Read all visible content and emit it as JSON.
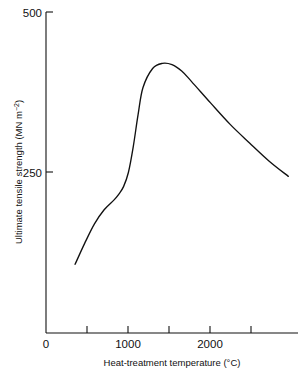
{
  "chart_data": {
    "type": "line",
    "title": "",
    "xlabel": "Heat-treatment temperature (°C)",
    "ylabel_main": "Ultimate tensile strength (MN m",
    "ylabel_sup": "−2",
    "ylabel_tail": ")",
    "ylabel_full": "Ultimate tensile strength (MN m−2)",
    "xlim": [
      0,
      2600
    ],
    "ylim": [
      0,
      500
    ],
    "grid": false,
    "legend": false,
    "x_tick_labels": [
      "0",
      "1000",
      "2000"
    ],
    "x_tick_label_values": [
      0,
      1000,
      2000
    ],
    "x_minor_tick_values": [
      500,
      1000,
      1500,
      2000,
      2500
    ],
    "y_tick_labels": [
      "250",
      "500"
    ],
    "y_tick_label_values": [
      250,
      500
    ],
    "series": [
      {
        "name": "Ultimate tensile strength",
        "x": [
          300,
          400,
          500,
          600,
          700,
          750,
          800,
          850,
          900,
          950,
          1000,
          1100,
          1200,
          1300,
          1400,
          1500,
          1700,
          1900,
          2100,
          2300,
          2500
        ],
        "values": [
          107,
          140,
          170,
          192,
          207,
          216,
          228,
          250,
          290,
          340,
          382,
          412,
          420,
          418,
          408,
          392,
          358,
          325,
          296,
          268,
          244
        ]
      }
    ],
    "annotations": {
      "peak_temperature": 1200,
      "peak_strength": 420,
      "start_temperature": 300,
      "start_strength": 107,
      "end_temperature": 2500,
      "end_strength": 244
    },
    "colors": {
      "curve": "#111111",
      "axis": "#111111",
      "background": "#ffffff"
    }
  },
  "labels": {
    "y_top": "500",
    "y_mid": "250",
    "x_zero": "0",
    "x_1000": "1000",
    "x_2000": "2000"
  }
}
